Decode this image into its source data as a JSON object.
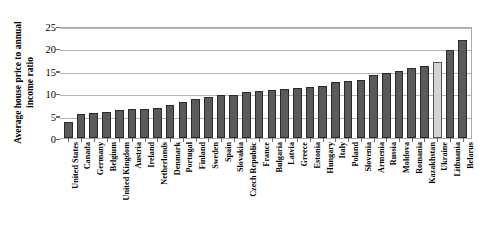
{
  "chart_data": {
    "type": "bar",
    "title": "",
    "xlabel": "",
    "ylabel": "Average house price to annual income ratio",
    "ylim": [
      0,
      25
    ],
    "yticks": [
      0,
      5,
      10,
      15,
      20,
      25
    ],
    "grid": true,
    "legend": null,
    "highlight_category": "Ukraine",
    "highlight_color": "#d4d4d4",
    "bar_color": "#5a5a5a",
    "categories": [
      "United States",
      "Canada",
      "Germany",
      "Belgium",
      "United Kingdom",
      "Austria",
      "Ireland",
      "Netherlands",
      "Denmark",
      "Portugal",
      "Finland",
      "Sweden",
      "Spain",
      "Slovakia",
      "Czech Republic",
      "France",
      "Bulgaria",
      "Latvia",
      "Greece",
      "Estonia",
      "Hungary",
      "Italy",
      "Poland",
      "Slovenia",
      "Armenia",
      "Russia",
      "Moldova",
      "Romania",
      "Kazakhstan",
      "Ukraine",
      "Lithuania",
      "Belarus"
    ],
    "values": [
      3.5,
      5.3,
      5.5,
      5.8,
      6.2,
      6.4,
      6.5,
      6.6,
      7.3,
      8.1,
      8.6,
      9.1,
      9.6,
      9.7,
      10.3,
      10.6,
      10.8,
      11.0,
      11.2,
      11.4,
      11.7,
      12.4,
      12.7,
      13.0,
      14.0,
      14.6,
      15.0,
      15.6,
      16.0,
      17.0,
      19.7,
      21.8
    ]
  }
}
